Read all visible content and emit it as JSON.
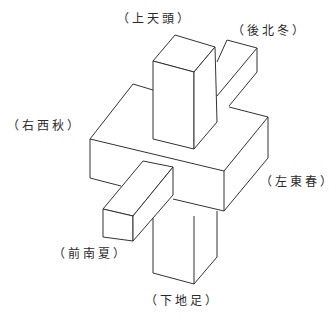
{
  "diagram": {
    "type": "isometric-line-drawing",
    "stroke_color": "#333333",
    "background": "#ffffff",
    "labels": {
      "top": "（上天頭）",
      "back": "（後北冬）",
      "right": "（右西秋）",
      "left": "（左東春）",
      "front": "（前南夏）",
      "bottom": "（下地足）"
    }
  }
}
